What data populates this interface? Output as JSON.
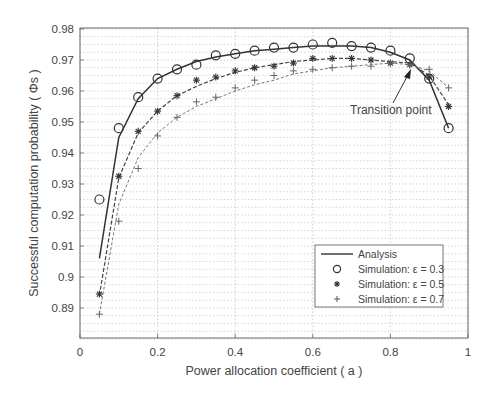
{
  "chart_data": {
    "type": "line",
    "title": "",
    "xlabel": "Power allocation coefficient ( a )",
    "ylabel": "Successful computation probability ( Φs )",
    "xlim": [
      0,
      1
    ],
    "ylim": [
      0.88,
      0.98
    ],
    "xticks": [
      "0",
      "0.2",
      "0.4",
      "0.6",
      "0.8",
      "1"
    ],
    "yticks": [
      "0.89",
      "0.9",
      "0.91",
      "0.92",
      "0.93",
      "0.94",
      "0.95",
      "0.96",
      "0.97",
      "0.98"
    ],
    "grid": true,
    "legend_position": "lower right",
    "x": [
      0.05,
      0.1,
      0.15,
      0.2,
      0.25,
      0.3,
      0.35,
      0.4,
      0.45,
      0.5,
      0.55,
      0.6,
      0.65,
      0.7,
      0.75,
      0.8,
      0.85,
      0.9,
      0.95
    ],
    "series": [
      {
        "name": "Simulation: ε = 0.3",
        "marker": "circle",
        "values": [
          0.925,
          0.948,
          0.958,
          0.964,
          0.967,
          0.9685,
          0.9715,
          0.972,
          0.973,
          0.974,
          0.974,
          0.975,
          0.9755,
          0.9745,
          0.974,
          0.973,
          0.9705,
          0.964,
          0.948
        ]
      },
      {
        "name": "Simulation: ε = 0.5",
        "marker": "asterisk",
        "values": [
          0.8945,
          0.9325,
          0.947,
          0.9535,
          0.9585,
          0.9635,
          0.9645,
          0.9665,
          0.9675,
          0.968,
          0.969,
          0.9705,
          0.9705,
          0.9705,
          0.97,
          0.969,
          0.9685,
          0.9645,
          0.955
        ]
      },
      {
        "name": "Simulation: ε = 0.7",
        "marker": "plus",
        "values": [
          0.888,
          0.918,
          0.935,
          0.9455,
          0.9515,
          0.9565,
          0.958,
          0.961,
          0.9635,
          0.965,
          0.9665,
          0.967,
          0.9675,
          0.968,
          0.968,
          0.969,
          0.9685,
          0.967,
          0.961
        ]
      }
    ],
    "analysis": [
      {
        "name": "Analysis ε = 0.3",
        "values": [
          0.906,
          0.945,
          0.9575,
          0.964,
          0.967,
          0.9695,
          0.971,
          0.972,
          0.973,
          0.9735,
          0.974,
          0.9745,
          0.9745,
          0.9745,
          0.974,
          0.9725,
          0.97,
          0.9635,
          0.948
        ]
      },
      {
        "name": "Analysis ε = 0.5",
        "values": [
          0.894,
          0.932,
          0.9465,
          0.9535,
          0.9585,
          0.9615,
          0.964,
          0.966,
          0.9675,
          0.9685,
          0.9695,
          0.97,
          0.9705,
          0.9705,
          0.97,
          0.9695,
          0.969,
          0.965,
          0.9555
        ]
      },
      {
        "name": "Analysis ε = 0.7",
        "values": [
          0.888,
          0.9235,
          0.9385,
          0.9465,
          0.9515,
          0.955,
          0.9575,
          0.96,
          0.962,
          0.9635,
          0.9655,
          0.9665,
          0.9675,
          0.968,
          0.9685,
          0.969,
          0.9685,
          0.9665,
          0.961
        ]
      }
    ],
    "legend": [
      "Analysis",
      "Simulation: ε = 0.3",
      "Simulation: ε = 0.5",
      "Simulation: ε = 0.7"
    ],
    "annotations": [
      {
        "text": "Transition point",
        "x": 0.86,
        "y": 0.9695
      }
    ]
  }
}
